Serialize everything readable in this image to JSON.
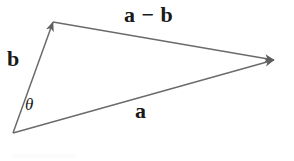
{
  "figure": {
    "width": 294,
    "height": 161,
    "background_color": "#ffffff",
    "stroke_color": "#6b6b6b",
    "label_color": "#1a1a1a"
  },
  "labels": {
    "vector_a_minus_b": "a − b",
    "vector_a": "a",
    "vector_b": "b",
    "angle_theta": "θ"
  },
  "chart_data": {
    "type": "diagram",
    "xlabel": "",
    "ylabel": "",
    "xlim": [
      0,
      294
    ],
    "ylim": [
      0,
      161
    ],
    "grid": false,
    "legend": "none",
    "points": [
      {
        "name": "origin",
        "x": 13,
        "y": 133
      },
      {
        "name": "head-of-b",
        "x": 53,
        "y": 22
      },
      {
        "name": "head-of-a",
        "x": 274,
        "y": 60
      }
    ],
    "vectors": [
      {
        "name": "b",
        "label": "b",
        "from": [
          13,
          133
        ],
        "to": [
          53,
          22
        ],
        "arrow_at": "to",
        "label_position": [
          7,
          48
        ],
        "color": "#6b6b6b"
      },
      {
        "name": "a",
        "label": "a",
        "from": [
          13,
          133
        ],
        "to": [
          274,
          60
        ],
        "arrow_at": "to",
        "label_position": [
          135,
          100
        ],
        "color": "#6b6b6b"
      },
      {
        "name": "a-minus-b",
        "label": "a − b",
        "from": [
          53,
          22
        ],
        "to": [
          274,
          60
        ],
        "arrow_at": "to",
        "label_position": [
          124,
          4
        ],
        "color": "#6b6b6b"
      }
    ],
    "angles": [
      {
        "name": "theta",
        "label": "θ",
        "vertex": [
          13,
          133
        ],
        "between": [
          "a",
          "b"
        ],
        "label_position": [
          25,
          96
        ]
      }
    ]
  }
}
